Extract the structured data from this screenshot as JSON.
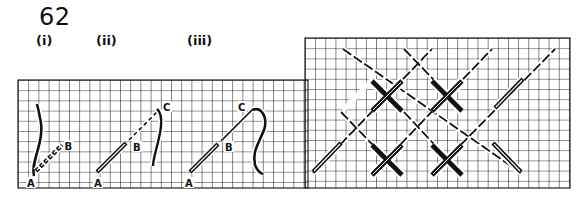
{
  "figure": {
    "number": "62",
    "steps": [
      {
        "label": "(i)",
        "points": [
          "A",
          "B"
        ]
      },
      {
        "label": "(ii)",
        "points": [
          "A",
          "B",
          "C"
        ]
      },
      {
        "label": "(iii)",
        "points": [
          "A",
          "B",
          "C"
        ]
      }
    ],
    "point_labels": {
      "a": "A",
      "b": "B",
      "c": "C"
    }
  },
  "colors": {
    "ink": "#111111",
    "grid": "#222222",
    "background": "#ffffff"
  }
}
